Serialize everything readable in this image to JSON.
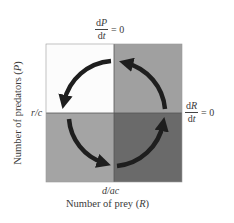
{
  "diagram": {
    "type": "phase-plane",
    "x_axis": {
      "label": "Number of prey",
      "variable": "R",
      "tick_label": "d/ac"
    },
    "y_axis": {
      "label": "Number of predators",
      "variable": "P",
      "tick_label": "r/c"
    },
    "isoclines": {
      "predator": {
        "numerator": "dP",
        "denominator": "dt",
        "equals": "= 0"
      },
      "prey": {
        "numerator": "dR",
        "denominator": "dt",
        "equals": "= 0"
      }
    },
    "quadrants": {
      "top_left": {
        "color": "#fcfcfc"
      },
      "top_right": {
        "color": "#a0a0a0"
      },
      "bottom_left": {
        "color": "#a4a4a4"
      },
      "bottom_right": {
        "color": "#6a6a6a"
      }
    },
    "arrow_color": "#1e1e1e",
    "cycle_direction": "counterclockwise"
  },
  "labels": {
    "y_axis_text": "Number of predators (",
    "y_axis_var": "P",
    "y_axis_close": ")",
    "x_axis_text": "Number of prey (",
    "x_axis_var": "R",
    "x_axis_close": ")",
    "x_tick": "d/ac",
    "y_tick": "r/c"
  }
}
